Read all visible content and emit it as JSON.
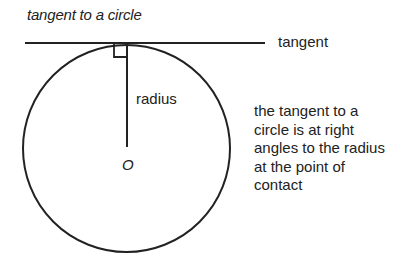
{
  "title": "tangent to a circle",
  "labels": {
    "tangent": "tangent",
    "radius": "radius",
    "center": "O"
  },
  "note_lines": [
    "the tangent to a",
    "circle is at right",
    "angles to the radius",
    "at the point of",
    "contact"
  ],
  "colors": {
    "stroke": "#222222",
    "background": "#ffffff"
  }
}
